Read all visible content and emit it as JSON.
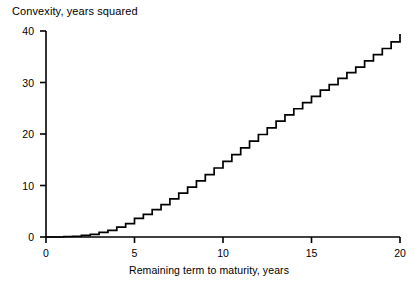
{
  "chart_data": {
    "type": "line",
    "title": "",
    "subtitle": "",
    "xlabel": "Remaining term to maturity, years",
    "ylabel": "Convexity, years squared",
    "xlim": [
      0,
      20
    ],
    "ylim": [
      0,
      40
    ],
    "grid": false,
    "legend": null,
    "line_style": "step",
    "line_color": "#000000",
    "xticks": [
      0,
      5,
      10,
      15,
      20
    ],
    "xticklabels": [
      "0",
      "5",
      "10",
      "15",
      "20"
    ],
    "yticks": [
      0,
      10,
      20,
      30,
      40
    ],
    "yticklabels": [
      "0",
      "10",
      "20",
      "30",
      "40"
    ],
    "series": [
      {
        "name": "Convexity",
        "x": [
          0,
          0.5,
          1,
          1.5,
          2,
          2.5,
          3,
          3.5,
          4,
          4.5,
          5,
          5.5,
          6,
          6.5,
          7,
          7.5,
          8,
          8.5,
          9,
          9.5,
          10,
          10.5,
          11,
          11.5,
          12,
          12.5,
          13,
          13.5,
          14,
          14.5,
          15,
          15.5,
          16,
          16.5,
          17,
          17.5,
          18,
          18.5,
          19,
          19.5,
          20
        ],
        "values": [
          0,
          0,
          0.1,
          0.15,
          0.3,
          0.5,
          0.9,
          1.3,
          1.9,
          2.6,
          3.6,
          4.4,
          5.3,
          6.3,
          7.4,
          8.5,
          9.7,
          10.9,
          12.1,
          13.4,
          14.7,
          16.0,
          17.3,
          18.6,
          19.9,
          21.2,
          22.5,
          23.7,
          24.9,
          26.1,
          27.3,
          28.5,
          29.6,
          30.8,
          31.9,
          33.0,
          34.2,
          35.4,
          36.6,
          37.9,
          39.4
        ]
      }
    ]
  },
  "axes": {
    "ylabel_text": "Convexity, years squared",
    "xlabel_text": "Remaining term to maturity, years"
  }
}
